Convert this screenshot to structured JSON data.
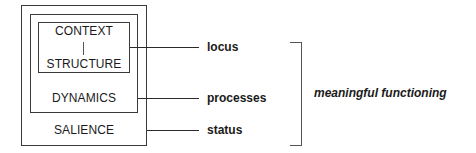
{
  "diagram": {
    "boxes": {
      "inner": {
        "top_label": "CONTEXT",
        "bottom_label": "STRUCTURE"
      },
      "middle": {
        "label": "DYNAMICS"
      },
      "outer": {
        "label": "SALIENCE"
      }
    },
    "connectors": [
      {
        "from": "CONTEXT/STRUCTURE",
        "label": "locus"
      },
      {
        "from": "DYNAMICS",
        "label": "processes"
      },
      {
        "from": "SALIENCE",
        "label": "status"
      }
    ],
    "bracket_label": "meaningful functioning",
    "colors": {
      "line": "#2a2a2a",
      "text": "#1a1a1a",
      "background": "#ffffff"
    }
  }
}
